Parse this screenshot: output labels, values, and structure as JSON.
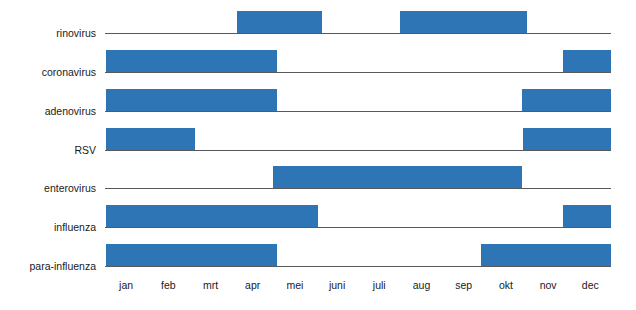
{
  "chart_data": {
    "type": "bar",
    "title": "",
    "xlabel": "",
    "ylabel": "",
    "orientation": "horizontal",
    "axis": {
      "x_start_px": 105,
      "x_end_px": 611,
      "month_width_px": 42.2,
      "grid": false,
      "legend": "none"
    },
    "categories": [
      "jan",
      "feb",
      "mrt",
      "apr",
      "mei",
      "juni",
      "juli",
      "aug",
      "sep",
      "okt",
      "nov",
      "dec"
    ],
    "series": [
      {
        "name": "rinovirus",
        "baseline_y": 33,
        "intervals": [
          {
            "start_month": "apr",
            "end_month": "mei",
            "start_px": 237,
            "end_px": 322
          },
          {
            "start_month": "aug",
            "end_month": "okt",
            "start_px": 400,
            "end_px": 527
          }
        ]
      },
      {
        "name": "coronavirus",
        "baseline_y": 72,
        "intervals": [
          {
            "start_month": "jan",
            "end_month": "apr",
            "start_px": 106,
            "end_px": 277
          },
          {
            "start_month": "dec",
            "end_month": "dec",
            "start_px": 563,
            "end_px": 611
          }
        ]
      },
      {
        "name": "adenovirus",
        "baseline_y": 111,
        "intervals": [
          {
            "start_month": "jan",
            "end_month": "apr",
            "start_px": 106,
            "end_px": 277
          },
          {
            "start_month": "nov",
            "end_month": "dec",
            "start_px": 522,
            "end_px": 611
          }
        ]
      },
      {
        "name": "RSV",
        "baseline_y": 150,
        "intervals": [
          {
            "start_month": "jan",
            "end_month": "feb",
            "start_px": 106,
            "end_px": 195
          },
          {
            "start_month": "nov",
            "end_month": "dec",
            "start_px": 523,
            "end_px": 611
          }
        ]
      },
      {
        "name": "enterovirus",
        "baseline_y": 188,
        "intervals": [
          {
            "start_month": "mei",
            "end_month": "okt",
            "start_px": 273,
            "end_px": 522
          }
        ]
      },
      {
        "name": "influenza",
        "baseline_y": 227,
        "intervals": [
          {
            "start_month": "jan",
            "end_month": "mei",
            "start_px": 106,
            "end_px": 318
          },
          {
            "start_month": "dec",
            "end_month": "dec",
            "start_px": 563,
            "end_px": 611
          }
        ]
      },
      {
        "name": "para-influenza",
        "baseline_y": 266,
        "intervals": [
          {
            "start_month": "jan",
            "end_month": "apr",
            "start_px": 106,
            "end_px": 277
          },
          {
            "start_month": "okt",
            "end_month": "dec",
            "start_px": 481,
            "end_px": 611
          }
        ]
      }
    ],
    "colors": {
      "bar": "#2E75B6",
      "axis": "#595959",
      "text": "#1a1a1a",
      "background": "#ffffff"
    }
  }
}
